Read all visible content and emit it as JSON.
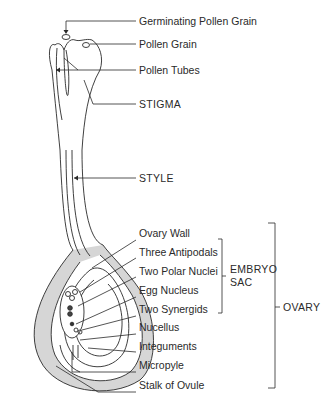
{
  "colors": {
    "line": "#2a2a2a",
    "shading": "#d4d4d4",
    "background": "#ffffff"
  },
  "labels": {
    "germinating_pollen_grain": "Germinating Pollen Grain",
    "pollen_grain": "Pollen Grain",
    "pollen_tubes": "Pollen Tubes",
    "stigma": "STIGMA",
    "style": "STYLE",
    "ovary_wall": "Ovary Wall",
    "three_antipodals": "Three Antipodals",
    "two_polar_nuclei": "Two Polar Nuclei",
    "egg_nucleus": "Egg Nucleus",
    "two_synergids": "Two Synergids",
    "nucellus": "Nucellus",
    "integuments": "Integuments",
    "micropyle": "Micropyle",
    "stalk_of_ovule": "Stalk of Ovule"
  },
  "groups": {
    "embryo_sac_line1": "EMBRYO",
    "embryo_sac_line2": "SAC",
    "ovary": "OVARY"
  }
}
